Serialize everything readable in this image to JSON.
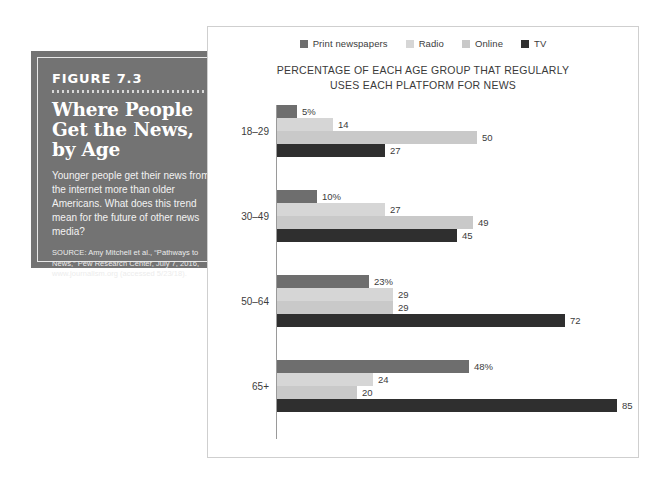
{
  "figure": {
    "number_label": "FIGURE 7.3",
    "title_lines": [
      "Where People",
      "Get the News,",
      "by Age"
    ],
    "description": "Younger people get their news from the internet more than older Americans. What does this trend mean for the future of other news media?",
    "source": "SOURCE: Amy Mitchell et al., “Pathways to News,” Pew Research Center, July 7, 2016, www.journalism.org (accessed 5/23/18)."
  },
  "chart_data": {
    "type": "bar",
    "orientation": "horizontal",
    "title": "PERCENTAGE OF EACH AGE GROUP THAT REGULARLY USES EACH PLATFORM FOR NEWS",
    "title_lines": [
      "PERCENTAGE OF EACH AGE GROUP THAT REGULARLY",
      "USES EACH PLATFORM FOR NEWS"
    ],
    "xlabel": "",
    "ylabel": "",
    "xlim": [
      0,
      90
    ],
    "grid": false,
    "legend_position": "top-center",
    "categories": [
      "18–29",
      "30–49",
      "50–64",
      "65+"
    ],
    "series": [
      {
        "name": "Print newspapers",
        "color": "#6e6e6e",
        "values": [
          5,
          10,
          23,
          48
        ],
        "labels": [
          "5%",
          "10%",
          "23%",
          "48%"
        ]
      },
      {
        "name": "Radio",
        "color": "#d6d6d6",
        "values": [
          14,
          27,
          29,
          24
        ],
        "labels": [
          "14",
          "27",
          "29",
          "24"
        ]
      },
      {
        "name": "Online",
        "color": "#c9c9c9",
        "values": [
          50,
          49,
          29,
          20
        ],
        "labels": [
          "50",
          "49",
          "29",
          "20"
        ]
      },
      {
        "name": "TV",
        "color": "#2f2f2f",
        "values": [
          27,
          45,
          72,
          85
        ],
        "labels": [
          "27",
          "45",
          "72",
          "85"
        ]
      }
    ]
  },
  "colors": {
    "box_background": "#737373",
    "panel_border": "#cfcfcf",
    "axis": "#9a9a9a",
    "text": "#3c3c3c"
  }
}
